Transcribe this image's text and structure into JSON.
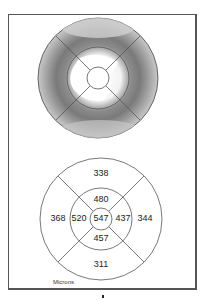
{
  "thickness_map": {
    "type": "grayscale-heatmap",
    "sectors": "ETDRS 9-zone grid"
  },
  "etdrs_grid": {
    "center": "547",
    "inner": {
      "superior": "480",
      "nasal_left": "520",
      "temporal_right": "437",
      "inferior": "457"
    },
    "outer": {
      "superior": "338",
      "left": "368",
      "right": "344",
      "inferior": "311"
    },
    "units_label": "Microns"
  },
  "colors": {
    "line": "#555555",
    "map_dark": "#6e6e6e",
    "map_light": "#ffffff"
  }
}
